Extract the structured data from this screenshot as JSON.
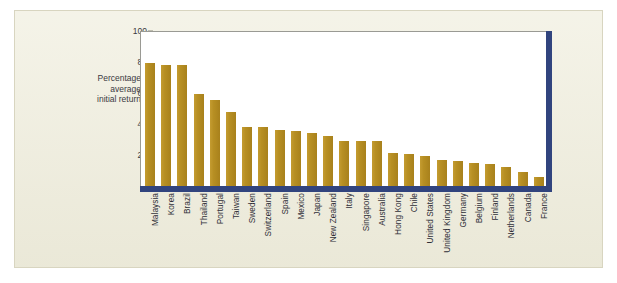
{
  "figure": {
    "background_color": "#efeddc",
    "plot_background_color": "#ffffff",
    "bar_color": "#b78f23",
    "axis_accent_color": "#31447e"
  },
  "axis": {
    "y_label": "Percentage\naverage\ninitial return",
    "y_ticks": [
      "100",
      "80",
      "60",
      "40",
      "20",
      "0"
    ]
  },
  "chart_data": {
    "type": "bar",
    "title": "",
    "xlabel": "",
    "ylabel": "Percentage average initial return",
    "ylim": [
      0,
      100
    ],
    "yticks": [
      0,
      20,
      40,
      60,
      80,
      100
    ],
    "grid": false,
    "legend": null,
    "categories": [
      "Malaysia",
      "Korea",
      "Brazil",
      "Thailand",
      "Portugal",
      "Taiwan",
      "Sweden",
      "Switzerland",
      "Spain",
      "Mexico",
      "Japan",
      "New Zealand",
      "Italy",
      "Singapore",
      "Australia",
      "Hong Kong",
      "Chile",
      "United States",
      "United Kingdom",
      "Germany",
      "Belgium",
      "Finland",
      "Netherlands",
      "Canada",
      "France"
    ],
    "values": [
      80,
      79,
      79,
      60,
      56,
      48.5,
      39,
      39,
      37,
      36,
      35,
      33,
      30,
      30,
      30,
      22,
      21,
      20,
      17.5,
      16.5,
      15.5,
      15,
      13,
      10,
      6.5
    ]
  }
}
